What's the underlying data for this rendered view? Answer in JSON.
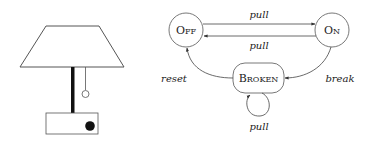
{
  "lamp": {
    "shade_color": "#ffffff",
    "stroke_color": "#555555",
    "pole_color": "#111111",
    "button_color": "#111111"
  },
  "states": [
    {
      "id": "off",
      "label_first": "O",
      "label_rest": "FF"
    },
    {
      "id": "on",
      "label_first": "O",
      "label_rest": "N"
    },
    {
      "id": "broken",
      "label_first": "B",
      "label_rest": "ROKEN"
    }
  ],
  "transitions": [
    {
      "from": "off",
      "to": "on",
      "label": "pull"
    },
    {
      "from": "on",
      "to": "off",
      "label": "pull"
    },
    {
      "from": "on",
      "to": "broken",
      "label": "break"
    },
    {
      "from": "broken",
      "to": "off",
      "label": "reset"
    },
    {
      "from": "broken",
      "to": "broken",
      "label": "pull"
    }
  ]
}
